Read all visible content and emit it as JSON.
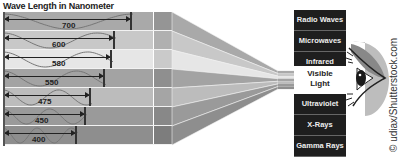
{
  "title": "Wave Length in Nanometer",
  "wavelengths": [
    {
      "label": "700",
      "shade": "#a9a9a9"
    },
    {
      "label": "600",
      "shade": "#c8c8c8"
    },
    {
      "label": "580",
      "shade": "#e6e6e6"
    },
    {
      "label": "550",
      "shade": "#a3a3a3"
    },
    {
      "label": "475",
      "shade": "#bcbcbc"
    },
    {
      "label": "450",
      "shade": "#9a9a9a"
    },
    {
      "label": "400",
      "shade": "#8e8e8e"
    }
  ],
  "spectrum": {
    "upper": [
      "Radio Waves",
      "Microwaves",
      "Infrared"
    ],
    "visible": [
      "Visible",
      "Light"
    ],
    "lower": [
      "Ultraviolet",
      "X-Rays",
      "Gamma Rays"
    ]
  },
  "credit": "© udiax/Shutterstock.com",
  "icons": {
    "eye": "eye-icon"
  }
}
